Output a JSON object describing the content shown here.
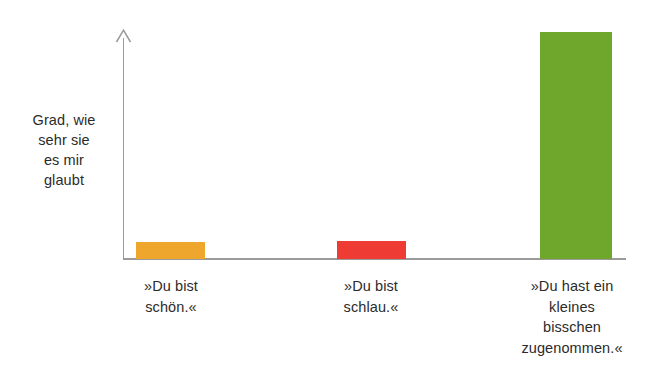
{
  "chart_data": {
    "type": "bar",
    "title": "",
    "subtitle": "",
    "xlabel": "",
    "ylabel": "Grad, wie sehr sie es mir glaubt",
    "ylabel_lines": [
      "Grad, wie",
      "sehr sie",
      "es mir",
      "glaubt"
    ],
    "grid": false,
    "legend": "none",
    "ylim": [
      0,
      100
    ],
    "axis_ticks": "none",
    "axis_color": "#9a9a9a",
    "background": "#ffffff",
    "categories": [
      "»Du bist schön.«",
      "»Du bist schlau.«",
      "»Du hast ein kleines bisschen zugenommen.«"
    ],
    "category_lines": [
      [
        "»Du bist",
        "schön.«"
      ],
      [
        "»Du bist",
        "schlau.«"
      ],
      [
        "»Du hast ein",
        "kleines",
        "bisschen",
        "zugenommen.«"
      ]
    ],
    "values": [
      7.5,
      8,
      100
    ],
    "colors": [
      "#efa62c",
      "#ee3b33",
      "#6fa72d"
    ],
    "bars": [
      {
        "label": "»Du bist schön.«",
        "value": 7.5,
        "color": "#efa62c",
        "x": 136,
        "width": 69
      },
      {
        "label": "»Du bist schlau.«",
        "value": 8,
        "color": "#ee3b33",
        "x": 337,
        "width": 69
      },
      {
        "label": "»Du hast ein kleines bisschen zugenommen.«",
        "value": 100,
        "color": "#6fa72d",
        "x": 540,
        "width": 72
      }
    ]
  }
}
